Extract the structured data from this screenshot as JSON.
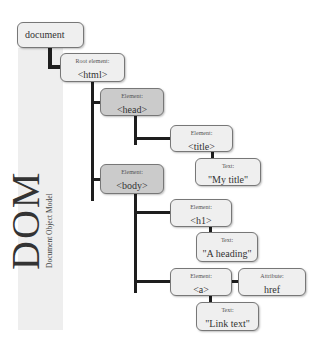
{
  "sidebar": {
    "title": "DOM",
    "subtitle": "Document Object Model"
  },
  "nodes": {
    "document": {
      "value": "document"
    },
    "html": {
      "label": "Root element:",
      "value": "<html>"
    },
    "head": {
      "label": "Element:",
      "value": "<head>"
    },
    "title": {
      "label": "Element:",
      "value": "<title>"
    },
    "title_text": {
      "label": "Text:",
      "value": "\"My title\""
    },
    "body": {
      "label": "Element:",
      "value": "<body>"
    },
    "h1": {
      "label": "Element:",
      "value": "<h1>"
    },
    "h1_text": {
      "label": "Text:",
      "value": "\"A heading\""
    },
    "a": {
      "label": "Element:",
      "value": "<a>"
    },
    "a_attr": {
      "label": "Attribute:",
      "value": "href"
    },
    "a_text": {
      "label": "Text:",
      "value": "\"Link text\""
    }
  },
  "colors": {
    "box_fill": "#efefef",
    "box_fill_dark": "#cbcbcb",
    "box_border": "#777777",
    "connector": "#1e1e1e",
    "panel": "#eeeeee"
  }
}
